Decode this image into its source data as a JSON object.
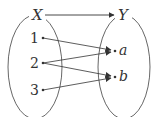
{
  "diagram": {
    "type": "mapping",
    "domain_set": {
      "label": "X",
      "elements": [
        "1",
        "2",
        "3"
      ]
    },
    "codomain_set": {
      "label": "Y",
      "elements": [
        "a",
        "b"
      ]
    },
    "top_arrow": {
      "from": "X",
      "to": "Y"
    },
    "mappings": [
      {
        "from": "1",
        "to": "a"
      },
      {
        "from": "2",
        "to": "a"
      },
      {
        "from": "2",
        "to": "b"
      },
      {
        "from": "3",
        "to": "b"
      }
    ],
    "colors": {
      "stroke": "#333333",
      "background": "#ffffff"
    }
  }
}
